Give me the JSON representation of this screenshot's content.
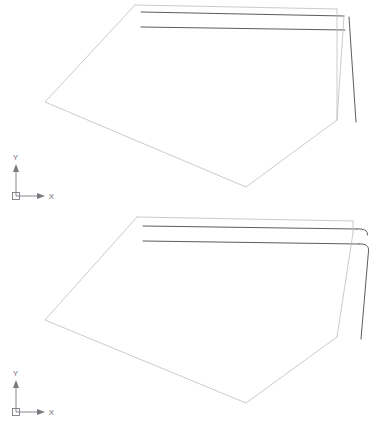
{
  "drawing": {
    "title": "CAD vector line drawing — two stacked sheet-metal panel views",
    "background_color": "#ffffff",
    "canvas": {
      "width": 377,
      "height": 431
    },
    "colors": {
      "thin": "#b9b9bd",
      "medium": "#8e8e94",
      "dark": "#4a4a4e",
      "ucs": "#7a7a80"
    }
  },
  "views": [
    {
      "name": "upper-view",
      "label": "Upper panel view",
      "ucs_icon": {
        "name": "ucs-icon-upper",
        "x_label": "X",
        "y_label": "Y",
        "origin": {
          "x": 16,
          "y": 196
        },
        "x_axis_length": 30,
        "y_axis_length": 32
      },
      "body_outline": "M135,5 L45,102 L246,187 L337,120 L337,9 Z",
      "top_edges": [
        {
          "name": "panel-top-edge-1",
          "path": "M135,5 L337,9",
          "weight": "thin"
        },
        {
          "name": "panel-fold-line-1",
          "path": "M141,12 L344,16",
          "weight": "dark"
        },
        {
          "name": "panel-fold-line-2",
          "path": "M141,27 L345,30",
          "weight": "dark"
        }
      ],
      "right_edges": [
        {
          "name": "panel-right-edge",
          "path": "M337,9 L337,120",
          "weight": "thin"
        },
        {
          "name": "panel-flange-edge",
          "path": "M348,16 L355,122",
          "weight": "dark"
        },
        {
          "name": "panel-flange-inner",
          "path": "M344,16 L337,120",
          "weight": "thin"
        }
      ]
    },
    {
      "name": "lower-view",
      "label": "Lower panel view",
      "ucs_icon": {
        "name": "ucs-icon-lower",
        "x_label": "X",
        "y_label": "Y",
        "origin": {
          "x": 16,
          "y": 412
        },
        "x_axis_length": 30,
        "y_axis_length": 32
      },
      "body_outline": "M137,217 L45,320 L246,403 L337,337 L337,221 Z",
      "top_edges": [
        {
          "name": "panel-top-edge-1",
          "path": "M137,217 L353,221",
          "weight": "thin"
        },
        {
          "name": "panel-fold-line-1",
          "path": "M143,226 L357,229",
          "weight": "dark"
        },
        {
          "name": "panel-fold-line-2",
          "path": "M143,241 L359,244",
          "weight": "dark"
        }
      ],
      "right_edges": [
        {
          "name": "panel-right-edge",
          "path": "M353,221 L353,232",
          "weight": "thin"
        },
        {
          "name": "panel-hook-upper",
          "path": "M357,229 C365,229 368,231 367,236",
          "weight": "dark"
        },
        {
          "name": "panel-hook-lower",
          "path": "M359,244 C366,244 368,247 368,252 L361,339",
          "weight": "dark"
        },
        {
          "name": "panel-flange-inner",
          "path": "M353,232 L337,337",
          "weight": "thin"
        }
      ]
    }
  ]
}
